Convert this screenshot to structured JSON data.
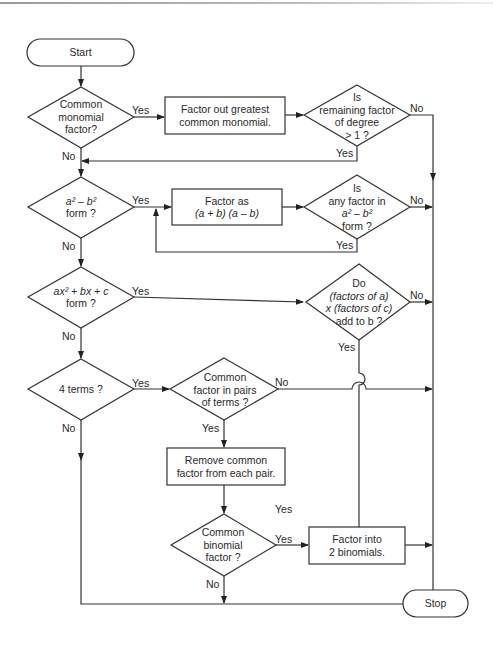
{
  "diagram": {
    "start": "Start",
    "stop": "Stop",
    "decisions": {
      "common_monomial": [
        "Common",
        "monomial",
        "factor?"
      ],
      "remaining_degree": [
        "Is",
        "remaining factor",
        "of degree",
        "> 1 ?"
      ],
      "diff_squares": [
        "a² – b²",
        "form ?"
      ],
      "any_factor_diff_squares": [
        "Is",
        "any factor in",
        "a² – b²",
        "form ?"
      ],
      "trinomial": [
        "ax² + bx + c",
        "form ?"
      ],
      "factors_add": [
        "Do",
        "(factors of a)",
        "x (factors of c)",
        "add to b ?"
      ],
      "four_terms": [
        "4 terms ?"
      ],
      "common_pairs": [
        "Common",
        "factor in pairs",
        "of terms ?"
      ],
      "common_binomial": [
        "Common",
        "binomial",
        "factor ?"
      ]
    },
    "processes": {
      "factor_gcm": [
        "Factor out greatest",
        "common monomial."
      ],
      "factor_diff_squares": [
        "Factor as",
        "(a + b) (a – b)"
      ],
      "remove_common_pair": [
        "Remove common",
        "factor from each pair."
      ],
      "factor_binomials": [
        "Factor into",
        "2 binomials."
      ]
    },
    "labels": {
      "yes": "Yes",
      "no": "No"
    }
  }
}
